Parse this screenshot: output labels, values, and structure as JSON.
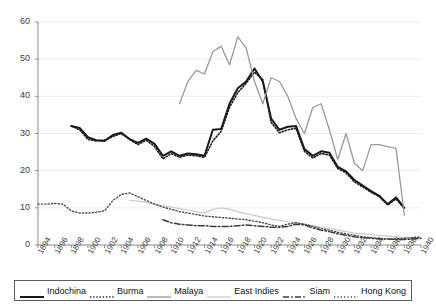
{
  "chart_data": {
    "type": "line",
    "title": "",
    "xlabel": "",
    "ylabel": "",
    "xlim": [
      1894,
      1940
    ],
    "ylim": [
      0,
      60
    ],
    "yticks": [
      0,
      10,
      20,
      30,
      40,
      50,
      60
    ],
    "grid": "horizontal",
    "legend_position": "bottom",
    "x": [
      1894,
      1896,
      1898,
      1900,
      1902,
      1904,
      1906,
      1908,
      1910,
      1912,
      1914,
      1916,
      1918,
      1920,
      1922,
      1924,
      1926,
      1928,
      1930,
      1932,
      1934,
      1936,
      1938,
      1940
    ],
    "xticks": [
      "1894",
      "1896",
      "1898",
      "1900",
      "1902",
      "1904",
      "1906",
      "1908",
      "1910",
      "1912",
      "1914",
      "1916",
      "1918",
      "1920",
      "1922",
      "1924",
      "1926",
      "1928",
      "1930",
      "1932",
      "1934",
      "1936",
      "1938",
      "1940"
    ],
    "series": [
      {
        "name": "Indochina",
        "style": "solid",
        "color": "#1a1a1a",
        "width": 2.0,
        "points": [
          [
            1898,
            32.0
          ],
          [
            1899,
            31.5
          ],
          [
            1900,
            29.0
          ],
          [
            1901,
            28.2
          ],
          [
            1902,
            28.0
          ],
          [
            1903,
            29.6
          ],
          [
            1904,
            30.2
          ],
          [
            1905,
            28.5
          ],
          [
            1906,
            27.5
          ],
          [
            1907,
            28.6
          ],
          [
            1908,
            27.2
          ],
          [
            1909,
            24.0
          ],
          [
            1910,
            25.2
          ],
          [
            1911,
            24.0
          ],
          [
            1912,
            24.6
          ],
          [
            1913,
            24.4
          ],
          [
            1914,
            24.0
          ],
          [
            1915,
            31.0
          ],
          [
            1916,
            31.2
          ],
          [
            1917,
            38.0
          ],
          [
            1918,
            42.2
          ],
          [
            1919,
            44.0
          ],
          [
            1920,
            47.5
          ],
          [
            1921,
            44.0
          ],
          [
            1922,
            34.0
          ],
          [
            1923,
            31.0
          ],
          [
            1924,
            31.8
          ],
          [
            1925,
            32.0
          ],
          [
            1926,
            25.8
          ],
          [
            1927,
            24.0
          ],
          [
            1928,
            25.2
          ],
          [
            1929,
            24.8
          ],
          [
            1930,
            21.0
          ],
          [
            1931,
            19.8
          ],
          [
            1932,
            17.5
          ],
          [
            1933,
            16.0
          ],
          [
            1934,
            14.5
          ],
          [
            1935,
            13.2
          ],
          [
            1936,
            11.0
          ],
          [
            1937,
            12.8
          ],
          [
            1938,
            10.0
          ]
        ]
      },
      {
        "name": "Burma",
        "style": "dotted-fine",
        "color": "#1a1a1a",
        "width": 1.6,
        "points": [
          [
            1898,
            32.0
          ],
          [
            1899,
            31.0
          ],
          [
            1900,
            28.4
          ],
          [
            1901,
            28.0
          ],
          [
            1902,
            28.2
          ],
          [
            1903,
            29.2
          ],
          [
            1904,
            30.0
          ],
          [
            1905,
            28.4
          ],
          [
            1906,
            27.0
          ],
          [
            1907,
            28.2
          ],
          [
            1908,
            26.5
          ],
          [
            1909,
            23.2
          ],
          [
            1910,
            24.6
          ],
          [
            1911,
            23.6
          ],
          [
            1912,
            24.2
          ],
          [
            1913,
            24.0
          ],
          [
            1914,
            23.6
          ],
          [
            1915,
            28.0
          ],
          [
            1916,
            30.6
          ],
          [
            1917,
            37.0
          ],
          [
            1918,
            41.0
          ],
          [
            1919,
            43.5
          ],
          [
            1920,
            46.5
          ],
          [
            1921,
            44.5
          ],
          [
            1922,
            33.0
          ],
          [
            1923,
            30.2
          ],
          [
            1924,
            31.0
          ],
          [
            1925,
            31.4
          ],
          [
            1926,
            25.2
          ],
          [
            1927,
            23.4
          ],
          [
            1928,
            24.6
          ],
          [
            1929,
            24.2
          ],
          [
            1930,
            20.6
          ],
          [
            1931,
            19.4
          ],
          [
            1932,
            17.0
          ],
          [
            1933,
            15.6
          ],
          [
            1934,
            14.2
          ],
          [
            1935,
            13.0
          ],
          [
            1936,
            10.8
          ],
          [
            1937,
            12.4
          ],
          [
            1938,
            9.8
          ]
        ]
      },
      {
        "name": "Malaya",
        "style": "solid",
        "color": "#9a9a9a",
        "width": 1.3,
        "points": [
          [
            1911,
            38.0
          ],
          [
            1912,
            44.0
          ],
          [
            1913,
            47.0
          ],
          [
            1914,
            46.0
          ],
          [
            1915,
            52.0
          ],
          [
            1916,
            53.5
          ],
          [
            1917,
            48.5
          ],
          [
            1918,
            56.0
          ],
          [
            1919,
            53.0
          ],
          [
            1920,
            44.0
          ],
          [
            1921,
            38.0
          ],
          [
            1922,
            45.0
          ],
          [
            1923,
            44.0
          ],
          [
            1924,
            40.0
          ],
          [
            1925,
            34.0
          ],
          [
            1926,
            30.0
          ],
          [
            1927,
            37.0
          ],
          [
            1928,
            38.0
          ],
          [
            1929,
            31.0
          ],
          [
            1930,
            23.0
          ],
          [
            1931,
            30.0
          ],
          [
            1932,
            22.0
          ],
          [
            1933,
            20.0
          ],
          [
            1934,
            27.0
          ],
          [
            1935,
            27.0
          ],
          [
            1936,
            26.5
          ],
          [
            1937,
            26.0
          ],
          [
            1938,
            8.0
          ]
        ]
      },
      {
        "name": "East Indies",
        "style": "solid",
        "color": "#cccccc",
        "width": 1.3,
        "points": [
          [
            1905,
            12.0
          ],
          [
            1906,
            11.8
          ],
          [
            1907,
            11.5
          ],
          [
            1908,
            11.0
          ],
          [
            1909,
            10.6
          ],
          [
            1910,
            10.2
          ],
          [
            1911,
            9.8
          ],
          [
            1912,
            9.4
          ],
          [
            1913,
            9.0
          ],
          [
            1914,
            8.6
          ],
          [
            1915,
            9.6
          ],
          [
            1916,
            10.0
          ],
          [
            1917,
            9.6
          ],
          [
            1918,
            9.0
          ],
          [
            1919,
            8.4
          ],
          [
            1920,
            8.0
          ],
          [
            1921,
            7.4
          ],
          [
            1922,
            7.0
          ],
          [
            1923,
            6.6
          ],
          [
            1924,
            6.2
          ],
          [
            1925,
            6.0
          ],
          [
            1926,
            5.6
          ],
          [
            1927,
            5.2
          ],
          [
            1928,
            4.8
          ],
          [
            1929,
            4.4
          ],
          [
            1930,
            4.0
          ],
          [
            1931,
            3.6
          ],
          [
            1932,
            3.2
          ],
          [
            1933,
            3.0
          ],
          [
            1934,
            2.8
          ],
          [
            1935,
            2.6
          ],
          [
            1936,
            2.4
          ],
          [
            1937,
            2.2
          ],
          [
            1938,
            2.0
          ],
          [
            1939,
            2.0
          ],
          [
            1940,
            2.0
          ]
        ]
      },
      {
        "name": "Siam",
        "style": "dash-dot",
        "color": "#3a3a3a",
        "width": 1.5,
        "points": [
          [
            1909,
            6.8
          ],
          [
            1910,
            6.0
          ],
          [
            1911,
            5.6
          ],
          [
            1912,
            5.4
          ],
          [
            1913,
            5.2
          ],
          [
            1914,
            5.2
          ],
          [
            1915,
            5.0
          ],
          [
            1916,
            5.0
          ],
          [
            1917,
            5.0
          ],
          [
            1918,
            5.2
          ],
          [
            1919,
            5.4
          ],
          [
            1920,
            5.2
          ],
          [
            1921,
            5.0
          ],
          [
            1922,
            4.8
          ],
          [
            1923,
            4.8
          ],
          [
            1924,
            5.0
          ],
          [
            1925,
            5.6
          ],
          [
            1926,
            5.4
          ],
          [
            1927,
            4.6
          ],
          [
            1928,
            4.0
          ],
          [
            1929,
            3.6
          ],
          [
            1930,
            3.0
          ],
          [
            1931,
            2.6
          ],
          [
            1932,
            2.2
          ],
          [
            1933,
            2.0
          ],
          [
            1934,
            1.8
          ],
          [
            1935,
            1.6
          ],
          [
            1936,
            1.6
          ],
          [
            1937,
            1.5
          ],
          [
            1938,
            1.5
          ],
          [
            1939,
            1.6
          ],
          [
            1940,
            1.8
          ]
        ]
      },
      {
        "name": "Hong Kong",
        "style": "dotted",
        "color": "#4a4a4a",
        "width": 1.4,
        "points": [
          [
            1894,
            11.0
          ],
          [
            1895,
            11.0
          ],
          [
            1896,
            11.2
          ],
          [
            1897,
            11.0
          ],
          [
            1898,
            9.2
          ],
          [
            1899,
            8.6
          ],
          [
            1900,
            8.6
          ],
          [
            1901,
            8.8
          ],
          [
            1902,
            9.2
          ],
          [
            1903,
            12.0
          ],
          [
            1904,
            13.6
          ],
          [
            1905,
            14.0
          ],
          [
            1906,
            13.0
          ],
          [
            1907,
            12.0
          ],
          [
            1908,
            11.0
          ],
          [
            1909,
            10.2
          ],
          [
            1910,
            9.6
          ],
          [
            1911,
            9.0
          ],
          [
            1912,
            8.6
          ],
          [
            1913,
            8.2
          ],
          [
            1914,
            7.8
          ],
          [
            1915,
            7.6
          ],
          [
            1916,
            7.4
          ],
          [
            1917,
            7.2
          ],
          [
            1918,
            7.0
          ],
          [
            1919,
            6.8
          ],
          [
            1920,
            6.4
          ],
          [
            1921,
            6.0
          ],
          [
            1922,
            5.4
          ],
          [
            1923,
            5.0
          ],
          [
            1924,
            5.6
          ],
          [
            1925,
            6.0
          ],
          [
            1926,
            5.6
          ],
          [
            1927,
            5.0
          ],
          [
            1928,
            4.4
          ],
          [
            1929,
            4.0
          ],
          [
            1930,
            3.4
          ],
          [
            1931,
            3.0
          ],
          [
            1932,
            2.6
          ],
          [
            1933,
            2.2
          ],
          [
            1934,
            2.0
          ],
          [
            1935,
            1.8
          ],
          [
            1936,
            1.6
          ],
          [
            1937,
            1.6
          ],
          [
            1938,
            1.8
          ],
          [
            1939,
            2.0
          ],
          [
            1940,
            2.2
          ]
        ]
      }
    ]
  },
  "legend": {
    "items": [
      {
        "label": "Indochina"
      },
      {
        "label": "Burma"
      },
      {
        "label": "Malaya"
      },
      {
        "label": "East Indies"
      },
      {
        "label": "Siam"
      },
      {
        "label": "Hong Kong"
      }
    ]
  }
}
